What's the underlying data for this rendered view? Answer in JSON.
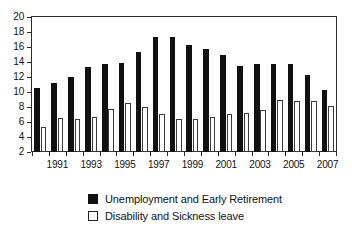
{
  "chart_data": {
    "type": "bar",
    "title": "",
    "subtitle": "",
    "xlabel": "",
    "ylabel": "",
    "ylim": [
      2,
      20
    ],
    "ytick_step": 2,
    "yticks": [
      20,
      18,
      16,
      14,
      12,
      10,
      8,
      6,
      4,
      2
    ],
    "grid": false,
    "legend_position": "bottom",
    "categories": [
      "1990",
      "1991",
      "1992",
      "1993",
      "1994",
      "1995",
      "1996",
      "1997",
      "1998",
      "1999",
      "2000",
      "2001",
      "2002",
      "2003",
      "2004",
      "2005",
      "2006",
      "2007"
    ],
    "xtick_labels": [
      "1991",
      "1993",
      "1995",
      "1997",
      "1999",
      "2001",
      "2003",
      "2005",
      "2007"
    ],
    "series": [
      {
        "name": "Unemployment and Early Retirement",
        "color": "#111111",
        "style": "filled",
        "values": [
          10.5,
          11.2,
          12.0,
          13.3,
          13.7,
          13.9,
          15.4,
          17.3,
          17.3,
          16.3,
          15.8,
          14.9,
          13.5,
          13.8,
          13.7,
          13.8,
          12.3,
          10.3
        ]
      },
      {
        "name": "Disability and Sickness leave",
        "color": "#ffffff",
        "style": "outlined",
        "values": [
          5.3,
          6.6,
          6.4,
          6.7,
          7.8,
          8.6,
          8.0,
          7.1,
          6.4,
          6.4,
          6.7,
          7.1,
          7.2,
          7.6,
          9.0,
          8.8,
          8.8,
          8.1
        ]
      }
    ]
  },
  "legend": {
    "items": [
      {
        "label": "Unemployment and Early Retirement",
        "swatch": "filled-square-black"
      },
      {
        "label": "Disability and Sickness leave",
        "swatch": "outlined-square-white"
      }
    ]
  }
}
